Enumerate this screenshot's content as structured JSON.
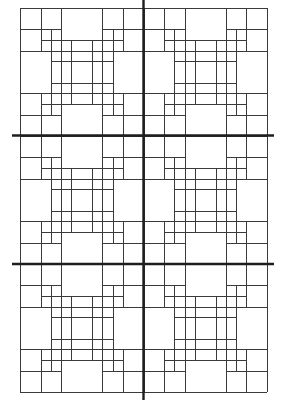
{
  "canvas": {
    "width": 287,
    "height": 400,
    "background": "#ffffff"
  },
  "pattern": {
    "name": "nested-square-quilt-grid",
    "layout": {
      "columns": 2,
      "rows": 3
    },
    "origin": {
      "x": 20,
      "y": 8
    },
    "block_size": {
      "width": 123.5,
      "height": 128
    },
    "units": 12,
    "line_color": "#3a3a3a",
    "block_segments": {
      "horizontal": [
        {
          "at": 0,
          "from": 0,
          "to": 12
        },
        {
          "at": 2,
          "from": 0,
          "to": 4
        },
        {
          "at": 2,
          "from": 8,
          "to": 12
        },
        {
          "at": 3,
          "from": 2,
          "to": 10
        },
        {
          "at": 4,
          "from": 0,
          "to": 12
        },
        {
          "at": 5,
          "from": 3,
          "to": 9
        },
        {
          "at": 7,
          "from": 3,
          "to": 9
        },
        {
          "at": 8,
          "from": 0,
          "to": 12
        },
        {
          "at": 9,
          "from": 2,
          "to": 10
        },
        {
          "at": 10,
          "from": 0,
          "to": 4
        },
        {
          "at": 10,
          "from": 8,
          "to": 12
        },
        {
          "at": 12,
          "from": 0,
          "to": 12
        }
      ],
      "vertical": [
        {
          "at": 0,
          "from": 0,
          "to": 12
        },
        {
          "at": 2,
          "from": 0,
          "to": 4
        },
        {
          "at": 2,
          "from": 8,
          "to": 12
        },
        {
          "at": 3,
          "from": 2,
          "to": 10
        },
        {
          "at": 4,
          "from": 0,
          "to": 12
        },
        {
          "at": 5,
          "from": 3,
          "to": 9
        },
        {
          "at": 7,
          "from": 3,
          "to": 9
        },
        {
          "at": 8,
          "from": 0,
          "to": 12
        },
        {
          "at": 9,
          "from": 2,
          "to": 10
        },
        {
          "at": 10,
          "from": 0,
          "to": 4
        },
        {
          "at": 10,
          "from": 8,
          "to": 12
        },
        {
          "at": 12,
          "from": 0,
          "to": 12
        }
      ]
    }
  },
  "divider_lines": {
    "color": "#1e1e1e",
    "vertical": [
      {
        "x": 143.5,
        "y1": 0,
        "y2": 400
      }
    ],
    "horizontal": [
      {
        "y": 135.5,
        "x1": 12,
        "x2": 274
      },
      {
        "y": 264,
        "x1": 12,
        "x2": 274
      }
    ]
  }
}
